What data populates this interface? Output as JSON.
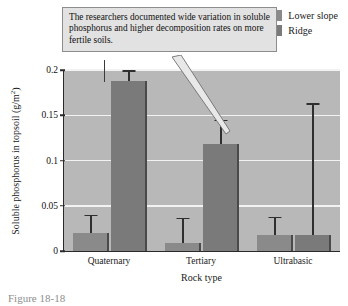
{
  "figure": {
    "caption": "Figure 18-18"
  },
  "callout": {
    "text": "The researchers documented wide variation in soluble phosphorus and higher decomposition rates on more fertile soils."
  },
  "chart_data": {
    "type": "bar",
    "title": "",
    "xlabel": "Rock type",
    "ylabel": "Soluble phosphorus in topsoil (g/m",
    "ylabel_sup": "2",
    "ylabel_suffix": ")",
    "categories": [
      "Quaternary",
      "Tertiary",
      "Ultrabasic"
    ],
    "ylim": [
      0,
      0.2
    ],
    "yticks": [
      0,
      0.05,
      0.1,
      0.15,
      0.2
    ],
    "ytick_labels": [
      "0",
      "0.05",
      "0.1",
      "0.15",
      "0.2"
    ],
    "grid": true,
    "legend_position": "top-right",
    "series": [
      {
        "name": "Lower slope",
        "color": "#8a8a8a",
        "values": [
          0.02,
          0.009,
          0.018
        ],
        "error_upper": [
          0.04,
          0.037,
          0.038
        ]
      },
      {
        "name": "Ridge",
        "color": "#7a7a7a",
        "values": [
          0.188,
          0.118,
          0.018
        ],
        "error_upper": [
          0.2,
          0.145,
          0.163
        ]
      }
    ]
  }
}
